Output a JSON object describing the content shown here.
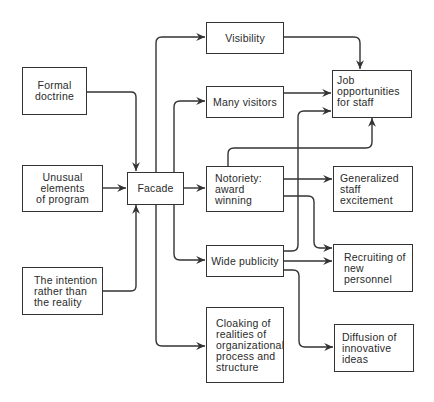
{
  "diagram": {
    "type": "flowchart",
    "colors": {
      "line": "#333333",
      "text": "#2a2a2a",
      "background": "#ffffff"
    },
    "nodes": {
      "formal_doctrine": "Formal\ndoctrine",
      "unusual_elements": "Unusual\nelements\nof program",
      "intention": "The intention\nrather than\nthe reality",
      "facade": "Facade",
      "visibility": "Visibility",
      "many_visitors": "Many visitors",
      "notoriety": "Notoriety:\naward winning",
      "wide_publicity": "Wide publicity",
      "cloaking": "Cloaking of\nrealities of\norganizational\nprocess and\nstructure",
      "job_opportunities": "Job opportunities\nfor staff",
      "generalized_excitement": "Generalized\nstaff excitement",
      "recruiting": "Recruiting of\nnew personnel",
      "diffusion": "Diffusion of\ninnovative ideas"
    },
    "edges": [
      [
        "Formal doctrine",
        "Facade"
      ],
      [
        "Unusual elements of program",
        "Facade"
      ],
      [
        "The intention rather than the reality",
        "Facade"
      ],
      [
        "Facade",
        "Visibility"
      ],
      [
        "Facade",
        "Many visitors"
      ],
      [
        "Facade",
        "Notoriety: award winning"
      ],
      [
        "Facade",
        "Wide publicity"
      ],
      [
        "Facade",
        "Cloaking of realities of organizational process and structure"
      ],
      [
        "Visibility",
        "Job opportunities for staff"
      ],
      [
        "Many visitors",
        "Job opportunities for staff"
      ],
      [
        "Notoriety: award winning",
        "Job opportunities for staff"
      ],
      [
        "Notoriety: award winning",
        "Generalized staff excitement"
      ],
      [
        "Notoriety: award winning",
        "Recruiting of new personnel"
      ],
      [
        "Wide publicity",
        "Job opportunities for staff"
      ],
      [
        "Wide publicity",
        "Recruiting of new personnel"
      ],
      [
        "Wide publicity",
        "Diffusion of innovative ideas"
      ]
    ]
  }
}
